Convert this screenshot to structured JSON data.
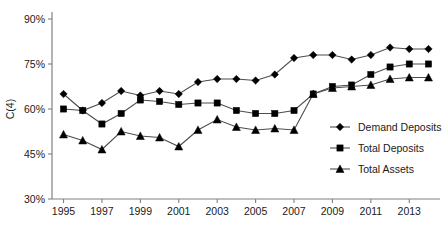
{
  "chart_data": {
    "type": "line",
    "title": "",
    "xlabel": "",
    "ylabel": "C(4)",
    "x": [
      1995,
      1996,
      1997,
      1998,
      1999,
      2000,
      2001,
      2002,
      2003,
      2004,
      2005,
      2006,
      2007,
      2008,
      2009,
      2010,
      2011,
      2012,
      2013,
      2014
    ],
    "xtick_labels": [
      "1995",
      "1997",
      "1999",
      "2001",
      "2003",
      "2005",
      "2007",
      "2009",
      "2011",
      "2013"
    ],
    "xtick_values": [
      1995,
      1997,
      1999,
      2001,
      2003,
      2005,
      2007,
      2009,
      2011,
      2013
    ],
    "ytick_labels": [
      "30%",
      "45%",
      "60%",
      "75%",
      "90%"
    ],
    "ytick_values": [
      30,
      45,
      60,
      75,
      90
    ],
    "ylim": [
      30,
      90
    ],
    "xlim": [
      1994.4,
      2014.6
    ],
    "grid": false,
    "legend_position": "inside-right",
    "series": [
      {
        "name": "Demand Deposits",
        "marker": "diamond",
        "values": [
          65.0,
          59.5,
          62.0,
          66.0,
          64.5,
          66.0,
          65.0,
          69.0,
          70.0,
          70.0,
          69.5,
          71.5,
          77.0,
          78.0,
          78.0,
          76.5,
          78.0,
          80.5,
          80.0,
          80.0
        ]
      },
      {
        "name": "Total Deposits",
        "marker": "square",
        "values": [
          60.0,
          59.5,
          55.0,
          58.5,
          63.0,
          62.5,
          61.5,
          62.0,
          62.0,
          59.5,
          58.5,
          58.5,
          59.5,
          65.0,
          67.5,
          68.0,
          71.5,
          74.0,
          75.0,
          75.0
        ]
      },
      {
        "name": "Total Assets",
        "marker": "triangle",
        "values": [
          51.5,
          49.5,
          46.5,
          52.5,
          51.0,
          50.5,
          47.5,
          53.0,
          56.5,
          54.0,
          53.0,
          53.5,
          53.0,
          65.0,
          67.0,
          67.5,
          68.0,
          70.0,
          70.5,
          70.5
        ]
      }
    ]
  },
  "legend": {
    "items": [
      {
        "label": "Demand Deposits",
        "marker": "diamond"
      },
      {
        "label": "Total Deposits",
        "marker": "square"
      },
      {
        "label": "Total Assets",
        "marker": "triangle"
      }
    ]
  },
  "axis": {
    "y_title": "C(4)"
  }
}
